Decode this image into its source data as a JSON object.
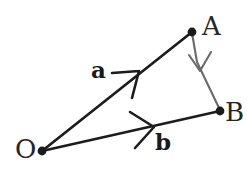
{
  "figure": {
    "kind": "vector-triangle-diagram",
    "background_color": "#ffffff",
    "width": 247,
    "height": 178,
    "points": [
      {
        "id": "O",
        "label": "O",
        "x": 42,
        "y": 151
      },
      {
        "id": "A",
        "label": "A",
        "x": 192,
        "y": 32
      },
      {
        "id": "B",
        "label": "B",
        "x": 220,
        "y": 111
      }
    ],
    "vectors": [
      {
        "id": "a",
        "label": "a",
        "from": "O",
        "to": "A",
        "color": "#1c1c1c",
        "stroke_width": 2.6,
        "arrow_style": "open-v-midpoint",
        "arrow_at": {
          "x": 138,
          "y": 72
        }
      },
      {
        "id": "b",
        "label": "b",
        "from": "O",
        "to": "B",
        "color": "#1c1c1c",
        "stroke_width": 2.6,
        "arrow_style": "open-v-midpoint",
        "arrow_at": {
          "x": 152,
          "y": 127
        }
      },
      {
        "id": "ab",
        "label": "",
        "from": "A",
        "to": "B",
        "color": "#666666",
        "stroke_width": 2.0,
        "arrow_style": "open-v-midpoint",
        "arrow_at": {
          "x": 201,
          "y": 68
        }
      }
    ],
    "dot_color": "#1a1a1a",
    "dot_radius": 4.2,
    "label_color": "#252525",
    "vector_label_color": "#1a1a1a"
  }
}
